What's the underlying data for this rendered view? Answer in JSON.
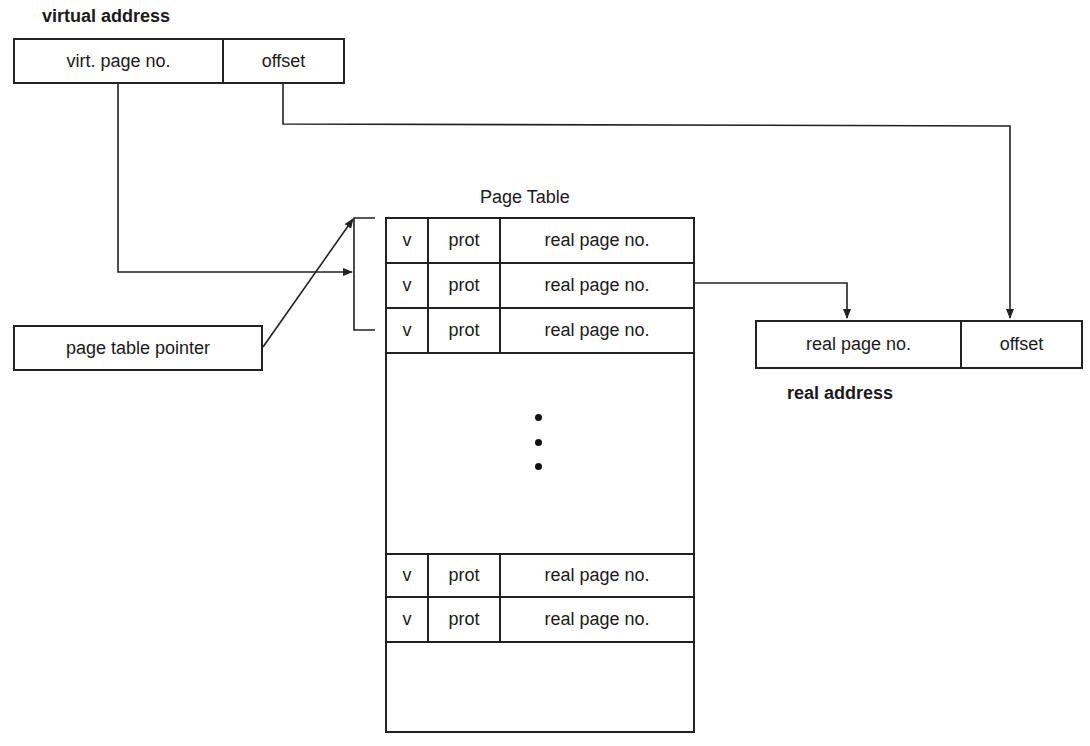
{
  "virtual_address": {
    "label": "virtual address",
    "fields": [
      "virt. page no.",
      "offset"
    ]
  },
  "page_table": {
    "title": "Page Table",
    "top_rows": [
      {
        "v": "v",
        "prot": "prot",
        "real": "real page no."
      },
      {
        "v": "v",
        "prot": "prot",
        "real": "real page no."
      },
      {
        "v": "v",
        "prot": "prot",
        "real": "real page no."
      }
    ],
    "ellipsis": "⋮",
    "bottom_rows": [
      {
        "v": "v",
        "prot": "prot",
        "real": "real page no."
      },
      {
        "v": "v",
        "prot": "prot",
        "real": "real page no."
      }
    ]
  },
  "page_table_pointer": {
    "label": "page table pointer"
  },
  "real_address": {
    "label": "real address",
    "fields": [
      "real page no.",
      "offset"
    ]
  }
}
